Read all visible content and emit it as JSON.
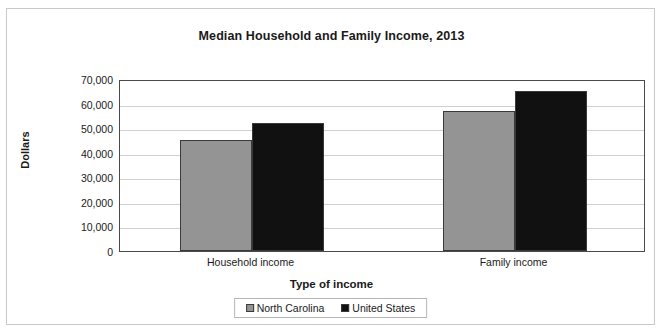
{
  "chart_data": {
    "type": "bar",
    "title": "Median Household and Family Income, 2013",
    "xlabel": "Type of income",
    "ylabel": "Dollars",
    "categories": [
      "Household income",
      "Family income"
    ],
    "series": [
      {
        "name": "North Carolina",
        "color": "#949494",
        "values": [
          45000,
          57000
        ]
      },
      {
        "name": "United States",
        "color": "#111111",
        "values": [
          52000,
          65000
        ]
      }
    ],
    "ylim": [
      0,
      70000
    ],
    "ytick_labels": [
      "70,000",
      "60,000",
      "50,000",
      "40,000",
      "30,000",
      "20,000",
      "10,000",
      "0"
    ],
    "ytick_values": [
      70000,
      60000,
      50000,
      40000,
      30000,
      20000,
      10000,
      0
    ],
    "grid": true,
    "legend_position": "bottom-center"
  }
}
